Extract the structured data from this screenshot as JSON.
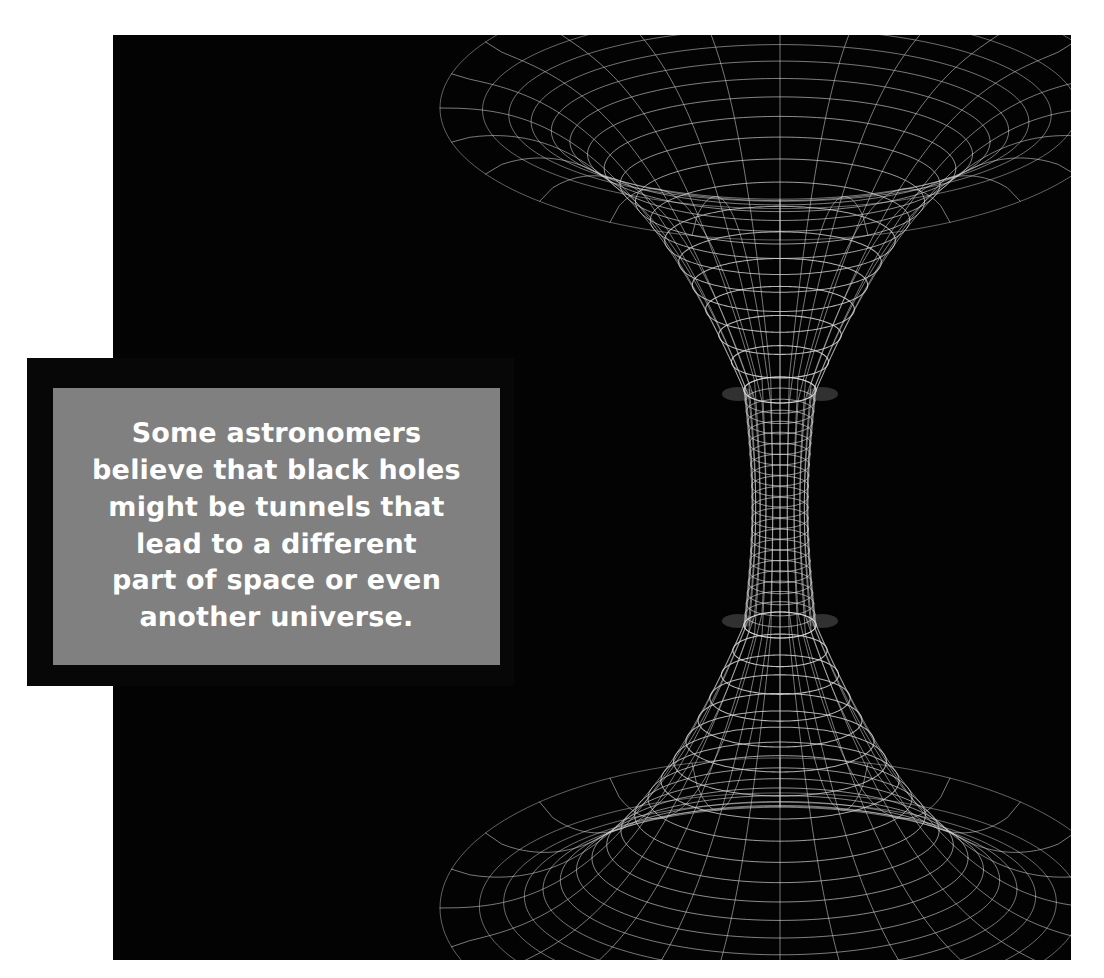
{
  "canvas": {
    "width": 1104,
    "height": 978,
    "background_color": "#ffffff"
  },
  "image_panel": {
    "name": "wormhole-illustration",
    "background_color": "#030303",
    "x": 113,
    "y": 35,
    "width": 958,
    "height": 925
  },
  "caption": {
    "frame_color": "#070707",
    "box_color": "#808080",
    "text_color": "#ffffff",
    "text": "Some astronomers\nbelieve that black holes\nmight be tunnels that\nlead to a different\npart of space or even\nanother universe.",
    "lines": [
      "Some astronomers",
      "believe that black holes",
      "might be tunnels that",
      "lead to a different",
      "part of space or even",
      "another universe."
    ]
  },
  "chart_data": {
    "type": "line",
    "xlabel": "",
    "ylabel": "",
    "grid": true,
    "legend": null,
    "line_color": "#d8d8d8",
    "figure": {
      "center_x": 667,
      "top_rim_y": 73,
      "top_throat_y": 355,
      "bottom_throat_y": 590,
      "bottom_rim_y": 873,
      "top_rim_radius_x": 340,
      "top_rim_radius_y": 132,
      "throat_radius_x": 36,
      "throat_radius_y": 13,
      "bottom_rim_radius_x": 340,
      "bottom_rim_radius_y": 150,
      "meridian_count": 24,
      "latitude_rings_top": 17,
      "latitude_rings_bottom": 19,
      "throat_rings": 22
    }
  }
}
